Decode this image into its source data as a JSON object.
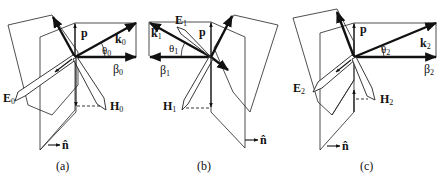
{
  "figure": {
    "panels": [
      {
        "id": "a",
        "caption": "(a)",
        "labels": {
          "p": "p",
          "k": "k",
          "k_sub": "0",
          "theta": "θ",
          "theta_sub": "0",
          "beta": "β",
          "beta_sub": "0",
          "E": "E",
          "E_sub": "0",
          "H": "H",
          "H_sub": "0",
          "n": "n̂"
        }
      },
      {
        "id": "b",
        "caption": "(b)",
        "labels": {
          "p": "p",
          "k": "k",
          "k_sub": "1",
          "theta": "θ",
          "theta_sub": "1",
          "beta": "β",
          "beta_sub": "1",
          "E": "E",
          "E_sub": "1",
          "H": "H",
          "H_sub": "1",
          "n": "n̂"
        }
      },
      {
        "id": "c",
        "caption": "(c)",
        "labels": {
          "p": "p",
          "k": "k",
          "k_sub": "2",
          "theta": "θ",
          "theta_sub": "2",
          "beta": "β",
          "beta_sub": "2",
          "E": "E",
          "E_sub": "2",
          "H": "H",
          "H_sub": "2",
          "n": "n̂"
        }
      }
    ]
  }
}
